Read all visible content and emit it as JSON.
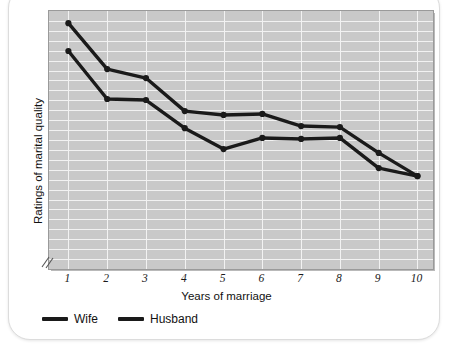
{
  "chart_data": {
    "type": "line",
    "title": "",
    "xlabel": "Years of marriage",
    "ylabel": "Ratings of marital quality",
    "x": [
      1,
      2,
      3,
      4,
      5,
      6,
      7,
      8,
      9,
      10
    ],
    "xtick_labels": [
      "1",
      "2",
      "3",
      "4",
      "5",
      "6",
      "7",
      "8",
      "9",
      "10"
    ],
    "ytick_labels": [],
    "ylim": [
      0,
      100
    ],
    "xlim": [
      0.5,
      10.4
    ],
    "grid": true,
    "legend_position": "below-left",
    "axis_break": true,
    "plot_background": "#c9c9c9",
    "gridline_color": "#f2f2f2",
    "series": [
      {
        "name": "Wife",
        "color": "#1a1a1a",
        "values": [
          95.3,
          77.5,
          74.0,
          61.2,
          59.7,
          60.1,
          55.4,
          55.0,
          45.0,
          36.0
        ]
      },
      {
        "name": "Husband",
        "color": "#1a1a1a",
        "values": [
          84.5,
          65.9,
          65.5,
          54.6,
          46.5,
          50.8,
          50.4,
          50.8,
          39.1,
          36.0
        ]
      }
    ]
  },
  "legend": {
    "items": [
      {
        "label": "Wife"
      },
      {
        "label": "Husband"
      }
    ]
  }
}
